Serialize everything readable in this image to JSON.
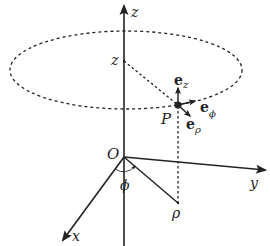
{
  "diagram": {
    "labels": {
      "z_axis": "z",
      "z_height": "z",
      "x_axis": "x",
      "y_axis": "y",
      "origin": "O",
      "point": "P",
      "rho": "ρ",
      "phi": "ϕ",
      "e_z_main": "e",
      "e_z_sub": "z",
      "e_phi_main": "e",
      "e_phi_sub": "ϕ",
      "e_rho_main": "e",
      "e_rho_sub": "ρ"
    },
    "colors": {
      "ink": "#222222",
      "background": "#ffffff"
    }
  }
}
